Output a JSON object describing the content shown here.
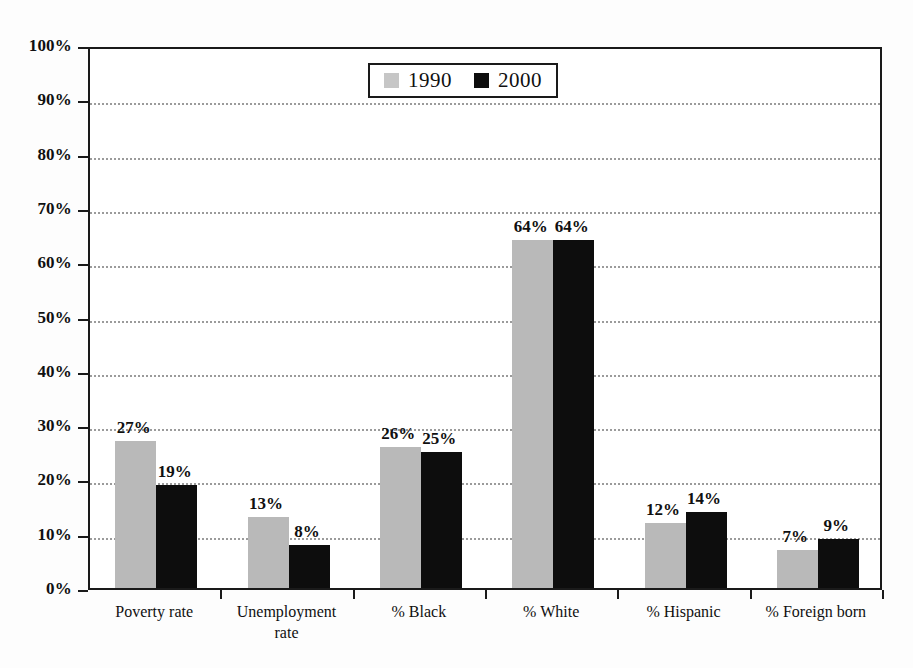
{
  "chart_data": {
    "type": "bar",
    "title": "",
    "subtitle": "",
    "xlabel": "",
    "ylabel": "",
    "categories": [
      "Poverty rate",
      "Unemployment rate",
      "% Black",
      "% White",
      "% Hispanic",
      "% Foreign born"
    ],
    "category_lines": [
      [
        "Poverty rate"
      ],
      [
        "Unemployment",
        "rate"
      ],
      [
        "% Black"
      ],
      [
        "% White"
      ],
      [
        "% Hispanic"
      ],
      [
        "% Foreign born"
      ]
    ],
    "series": [
      {
        "name": "1990",
        "color": "#b9b9b9",
        "values": [
          27,
          13,
          26,
          64,
          12,
          7
        ],
        "labels": [
          "27%",
          "13%",
          "26%",
          "64%",
          "12%",
          "7%"
        ]
      },
      {
        "name": "2000",
        "color": "#0d0d0d",
        "values": [
          19,
          8,
          25,
          64,
          14,
          9
        ],
        "labels": [
          "19%",
          "8%",
          "25%",
          "64%",
          "14%",
          "9%"
        ]
      }
    ],
    "ylim": [
      0,
      100
    ],
    "ytick_values": [
      0,
      10,
      20,
      30,
      40,
      50,
      60,
      70,
      80,
      90,
      100
    ],
    "ytick_labels": [
      "0%",
      "10%",
      "20%",
      "30%",
      "40%",
      "50%",
      "60%",
      "70%",
      "80%",
      "90%",
      "100%"
    ],
    "grid": "horizontal-dotted",
    "legend": {
      "position": "top-center",
      "entries": [
        {
          "label": "1990",
          "swatch": "gray-square-swatch"
        },
        {
          "label": "2000",
          "swatch": "black-square-swatch"
        }
      ]
    },
    "axis_color": "#1a1a1a",
    "gridline_color": "#9b9b9b",
    "background_color": "#ffffff"
  }
}
